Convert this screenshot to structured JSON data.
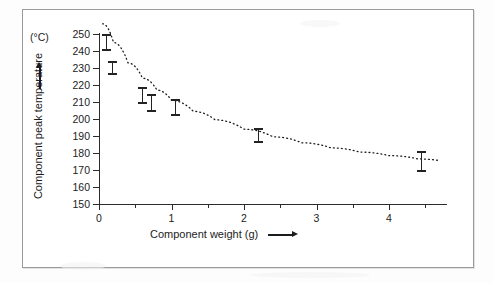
{
  "figure": {
    "unit_label": "(°C)",
    "y_axis_title": "Component peak temperature",
    "x_axis_title": "Component weight (g)",
    "y_arrow_name": "up-arrow-icon",
    "x_arrow_name": "right-arrow-icon"
  },
  "chart_data": {
    "type": "scatter",
    "title": "",
    "xlabel": "Component weight (g)",
    "ylabel": "Component peak temperature",
    "yunit": "°C",
    "xlim": [
      0,
      4.8
    ],
    "ylim": [
      150,
      250
    ],
    "grid": false,
    "legend": null,
    "x_ticks": [
      0,
      1,
      2,
      3,
      4
    ],
    "x_tick_labels": [
      "0",
      "1",
      "2",
      "3",
      "4"
    ],
    "x_minor_ticks": [
      0.5,
      1.5,
      2.5,
      3.5,
      4.5
    ],
    "y_ticks": [
      150,
      160,
      170,
      180,
      190,
      200,
      210,
      220,
      230,
      240,
      250
    ],
    "y_tick_labels": [
      "150",
      "160",
      "170",
      "180",
      "190",
      "200",
      "210",
      "220",
      "230",
      "240",
      "250"
    ],
    "error_bars": true,
    "points": [
      {
        "x": 0.1,
        "y": 245.0,
        "y_upper": 250.0,
        "y_lower": 240.0
      },
      {
        "x": 0.18,
        "y": 230.0,
        "y_upper": 234.0,
        "y_lower": 226.0
      },
      {
        "x": 0.6,
        "y": 214.0,
        "y_upper": 219.0,
        "y_lower": 209.0
      },
      {
        "x": 0.72,
        "y": 209.0,
        "y_upper": 214.5,
        "y_lower": 204.0
      },
      {
        "x": 1.05,
        "y": 206.5,
        "y_upper": 212.0,
        "y_lower": 201.5
      },
      {
        "x": 2.2,
        "y": 190.5,
        "y_upper": 195.0,
        "y_lower": 186.0
      },
      {
        "x": 4.45,
        "y": 175.0,
        "y_upper": 181.0,
        "y_lower": 169.0
      }
    ],
    "trend_line": {
      "style": "dotted",
      "description": "exponential decay fit",
      "points": [
        {
          "x": 0.05,
          "y": 256.0
        },
        {
          "x": 0.2,
          "y": 245.0
        },
        {
          "x": 0.4,
          "y": 233.0
        },
        {
          "x": 0.6,
          "y": 224.0
        },
        {
          "x": 0.8,
          "y": 217.0
        },
        {
          "x": 1.0,
          "y": 211.0
        },
        {
          "x": 1.3,
          "y": 204.5
        },
        {
          "x": 1.6,
          "y": 199.5
        },
        {
          "x": 2.0,
          "y": 194.0
        },
        {
          "x": 2.4,
          "y": 189.5
        },
        {
          "x": 2.8,
          "y": 186.0
        },
        {
          "x": 3.2,
          "y": 183.0
        },
        {
          "x": 3.6,
          "y": 180.5
        },
        {
          "x": 4.0,
          "y": 178.5
        },
        {
          "x": 4.4,
          "y": 176.5
        },
        {
          "x": 4.7,
          "y": 175.5
        }
      ]
    }
  },
  "colors": {
    "ink": "#1c1c1c",
    "axis": "#2b2b2b",
    "marker": "#232323",
    "frame": "#9a9a9a",
    "background": "#ffffff"
  }
}
